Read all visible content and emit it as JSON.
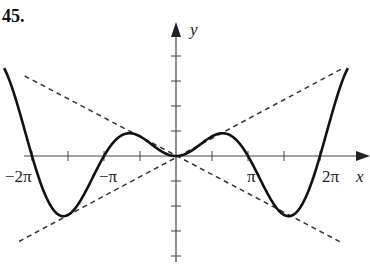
{
  "problem_number": "45.",
  "chart_data": {
    "type": "line",
    "title": "",
    "xlabel": "x",
    "ylabel": "y",
    "x_tick_labels": [
      "−2π",
      "−π",
      "π",
      "2π"
    ],
    "x_tick_values": [
      -6.2832,
      -3.1416,
      3.1416,
      6.2832
    ],
    "x_minor_tick_step": 1.5708,
    "y_tick_step": 1,
    "xlim": [
      -7.4,
      8.2
    ],
    "ylim": [
      -4,
      5.2
    ],
    "grid": false,
    "legend": null,
    "series": [
      {
        "name": "y = (x/2) sin x",
        "style": "solid",
        "x": [
          -7.5,
          -6.2832,
          -4.8,
          -3.1416,
          -2.0,
          0,
          2.0,
          3.1416,
          4.8,
          6.2832,
          7.5
        ],
        "values": [
          -3.5,
          0,
          -2.4,
          0,
          0.91,
          0,
          0.91,
          0,
          -2.4,
          0,
          3.5
        ]
      },
      {
        "name": "y = x/2",
        "style": "dashed",
        "x": [
          -6.85,
          7.3
        ],
        "values": [
          -3.42,
          3.52
        ]
      },
      {
        "name": "y = −x/2",
        "style": "dashed",
        "x": [
          -6.6,
          7.3
        ],
        "values": [
          3.2,
          -3.5
        ]
      }
    ]
  }
}
